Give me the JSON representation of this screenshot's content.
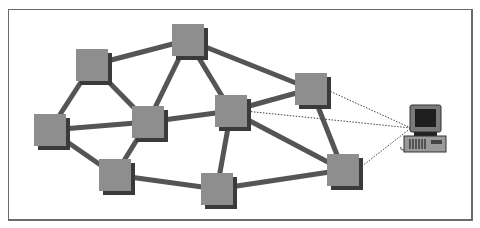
{
  "diagram": {
    "type": "network-topology",
    "colors": {
      "node_fill": "#8e8e8e",
      "node_shadow": "#3a3a3a",
      "link": "#555555",
      "dotted_link": "#444444",
      "frame": "#6a6a6a"
    },
    "node_size": 32,
    "nodes": [
      {
        "id": "A",
        "x": 92,
        "y": 65
      },
      {
        "id": "B",
        "x": 188,
        "y": 40
      },
      {
        "id": "C",
        "x": 50,
        "y": 130
      },
      {
        "id": "D",
        "x": 148,
        "y": 122
      },
      {
        "id": "E",
        "x": 231,
        "y": 111
      },
      {
        "id": "F",
        "x": 311,
        "y": 89
      },
      {
        "id": "G",
        "x": 115,
        "y": 175
      },
      {
        "id": "H",
        "x": 217,
        "y": 189
      },
      {
        "id": "I",
        "x": 343,
        "y": 170
      }
    ],
    "links": [
      [
        "A",
        "B"
      ],
      [
        "A",
        "C"
      ],
      [
        "A",
        "D"
      ],
      [
        "B",
        "D"
      ],
      [
        "B",
        "E"
      ],
      [
        "B",
        "F"
      ],
      [
        "C",
        "D"
      ],
      [
        "C",
        "G"
      ],
      [
        "D",
        "G"
      ],
      [
        "D",
        "E"
      ],
      [
        "E",
        "F"
      ],
      [
        "E",
        "I"
      ],
      [
        "E",
        "H"
      ],
      [
        "F",
        "I"
      ],
      [
        "G",
        "H"
      ],
      [
        "H",
        "I"
      ]
    ],
    "host": {
      "label": "computer",
      "x": 425,
      "y": 128
    },
    "dotted_links": [
      "F",
      "E",
      "I"
    ]
  }
}
